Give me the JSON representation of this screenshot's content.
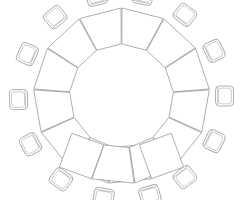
{
  "drawing": {
    "title": "Horseshoe table seating plan",
    "kind": "floor-plan",
    "view": "top-down",
    "canvas": {
      "width": 243,
      "height": 200
    },
    "background_color": "#ffffff",
    "line_color": "#8c8c90",
    "detail_line_color": "#a8a8ad",
    "stroke_width": 0.7
  },
  "table": {
    "name": "horseshoe-table",
    "shape": "horseshoe",
    "opening_direction": "top",
    "center_x": 121.5,
    "center_y": 96,
    "inner_radius": 52,
    "outer_radius": 88,
    "start_angle_deg": 70,
    "end_angle_deg": 470,
    "segment_count": 14,
    "segment_gap_deg": 0.6,
    "end_cap": {
      "present": true,
      "count": 2,
      "description": "squared rectangular end panel at each open end",
      "length": 34
    }
  },
  "chairs": {
    "name": "chair-ring",
    "count": 14,
    "radius": 103,
    "width": 20,
    "depth": 18,
    "corner_radius": 4,
    "angles_deg": [
      74,
      100,
      126,
      152,
      178,
      204,
      230,
      256,
      282,
      308,
      334,
      360,
      386,
      412
    ],
    "style": "rounded-square with seat outline and back rail"
  },
  "chair_list": [
    {
      "id": 1,
      "label": "Seat 1",
      "angle_deg": 74
    },
    {
      "id": 2,
      "label": "Seat 2",
      "angle_deg": 100
    },
    {
      "id": 3,
      "label": "Seat 3",
      "angle_deg": 126
    },
    {
      "id": 4,
      "label": "Seat 4",
      "angle_deg": 152
    },
    {
      "id": 5,
      "label": "Seat 5",
      "angle_deg": 178
    },
    {
      "id": 6,
      "label": "Seat 6",
      "angle_deg": 204
    },
    {
      "id": 7,
      "label": "Seat 7",
      "angle_deg": 230
    },
    {
      "id": 8,
      "label": "Seat 8",
      "angle_deg": 256
    },
    {
      "id": 9,
      "label": "Seat 9",
      "angle_deg": 282
    },
    {
      "id": 10,
      "label": "Seat 10",
      "angle_deg": 308
    },
    {
      "id": 11,
      "label": "Seat 11",
      "angle_deg": 334
    },
    {
      "id": 12,
      "label": "Seat 12",
      "angle_deg": 360
    },
    {
      "id": 13,
      "label": "Seat 13",
      "angle_deg": 386
    },
    {
      "id": 14,
      "label": "Seat 14",
      "angle_deg": 412
    }
  ]
}
